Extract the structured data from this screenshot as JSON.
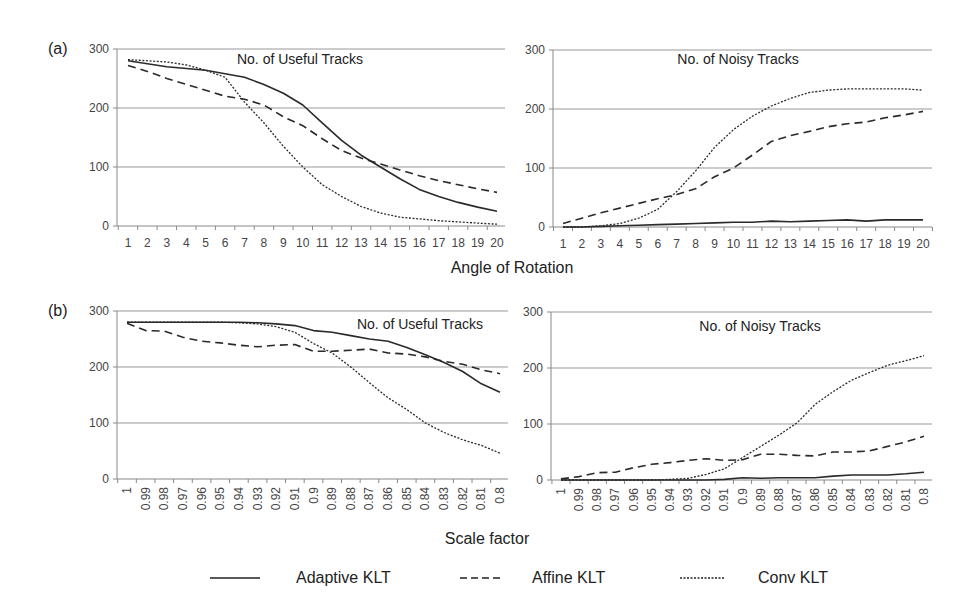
{
  "figure": {
    "panel_labels": [
      "(a)",
      "(b)"
    ],
    "shared_xlabels": {
      "a": "Angle of Rotation",
      "b": "Scale factor"
    },
    "legend": [
      {
        "name": "Adaptive KLT",
        "style": "solid"
      },
      {
        "name": "Affine KLT",
        "style": "dashed"
      },
      {
        "name": "Conv KLT",
        "style": "dotted"
      }
    ]
  },
  "chart_data": [
    {
      "id": "a-useful",
      "type": "line",
      "panel": "(a)",
      "title": "No. of Useful Tracks",
      "xlabel": "Angle of Rotation",
      "ylabel": "",
      "categories": [
        "1",
        "2",
        "3",
        "4",
        "5",
        "6",
        "7",
        "8",
        "9",
        "10",
        "11",
        "12",
        "13",
        "14",
        "15",
        "16",
        "17",
        "18",
        "19",
        "20"
      ],
      "ylim": [
        0,
        300
      ],
      "yticks": [
        0,
        100,
        200,
        300
      ],
      "grid": true,
      "series": [
        {
          "name": "Adaptive KLT",
          "style": "solid",
          "values": [
            280,
            275,
            270,
            267,
            264,
            258,
            252,
            240,
            225,
            205,
            175,
            145,
            120,
            100,
            80,
            62,
            50,
            40,
            32,
            25
          ]
        },
        {
          "name": "Affine KLT",
          "style": "dashed",
          "values": [
            272,
            262,
            250,
            240,
            230,
            220,
            215,
            205,
            185,
            170,
            148,
            128,
            115,
            105,
            95,
            85,
            77,
            70,
            63,
            57
          ]
        },
        {
          "name": "Conv KLT",
          "style": "dotted",
          "values": [
            282,
            280,
            278,
            273,
            264,
            252,
            210,
            175,
            135,
            100,
            70,
            50,
            33,
            22,
            15,
            12,
            9,
            7,
            5,
            3
          ]
        }
      ]
    },
    {
      "id": "a-noisy",
      "type": "line",
      "panel": "(a)",
      "title": "No. of Noisy Tracks",
      "xlabel": "Angle of Rotation",
      "ylabel": "",
      "categories": [
        "1",
        "2",
        "3",
        "4",
        "5",
        "6",
        "7",
        "8",
        "9",
        "10",
        "11",
        "12",
        "13",
        "14",
        "15",
        "16",
        "17",
        "18",
        "19",
        "20"
      ],
      "ylim": [
        0,
        300
      ],
      "yticks": [
        0,
        100,
        200,
        300
      ],
      "grid": true,
      "series": [
        {
          "name": "Adaptive KLT",
          "style": "solid",
          "values": [
            0,
            0,
            1,
            2,
            3,
            4,
            5,
            6,
            7,
            8,
            8,
            10,
            9,
            10,
            11,
            12,
            10,
            12,
            12,
            12
          ]
        },
        {
          "name": "Affine KLT",
          "style": "dashed",
          "values": [
            6,
            15,
            24,
            32,
            40,
            48,
            55,
            65,
            85,
            100,
            122,
            145,
            155,
            162,
            170,
            175,
            178,
            185,
            190,
            196
          ]
        },
        {
          "name": "Conv KLT",
          "style": "dotted",
          "values": [
            0,
            0,
            2,
            6,
            15,
            30,
            60,
            95,
            135,
            165,
            188,
            205,
            218,
            228,
            232,
            234,
            234,
            234,
            234,
            232
          ]
        }
      ]
    },
    {
      "id": "b-useful",
      "type": "line",
      "panel": "(b)",
      "title": "No. of Useful Tracks",
      "xlabel": "Scale factor",
      "ylabel": "",
      "categories": [
        "1",
        "0.99",
        "0.98",
        "0.97",
        "0.96",
        "0.95",
        "0.94",
        "0.93",
        "0.92",
        "0.91",
        "0.9",
        "0.89",
        "0.88",
        "0.87",
        "0.86",
        "0.85",
        "0.84",
        "0.83",
        "0.82",
        "0.81",
        "0.8"
      ],
      "ylim": [
        0,
        300
      ],
      "yticks": [
        0,
        100,
        200,
        300
      ],
      "grid": true,
      "series": [
        {
          "name": "Adaptive KLT",
          "style": "solid",
          "values": [
            280,
            280,
            280,
            280,
            280,
            280,
            280,
            279,
            277,
            274,
            265,
            262,
            256,
            250,
            246,
            235,
            222,
            208,
            192,
            170,
            155
          ]
        },
        {
          "name": "Affine KLT",
          "style": "dashed",
          "values": [
            278,
            265,
            264,
            253,
            246,
            243,
            239,
            236,
            239,
            240,
            228,
            228,
            230,
            232,
            225,
            223,
            218,
            210,
            205,
            195,
            188
          ]
        },
        {
          "name": "Conv KLT",
          "style": "dotted",
          "values": [
            280,
            280,
            280,
            280,
            280,
            280,
            279,
            277,
            272,
            262,
            242,
            225,
            200,
            172,
            145,
            124,
            100,
            83,
            70,
            60,
            46
          ]
        }
      ]
    },
    {
      "id": "b-noisy",
      "type": "line",
      "panel": "(b)",
      "title": "No. of Noisy Tracks",
      "xlabel": "Scale factor",
      "ylabel": "",
      "categories": [
        "1",
        "0.99",
        "0.98",
        "0.97",
        "0.96",
        "0.95",
        "0.94",
        "0.93",
        "0.92",
        "0.91",
        "0.9",
        "0.89",
        "0.88",
        "0.87",
        "0.86",
        "0.85",
        "0.84",
        "0.83",
        "0.82",
        "0.81",
        "0.8"
      ],
      "ylim": [
        0,
        300
      ],
      "yticks": [
        0,
        100,
        200,
        300
      ],
      "grid": true,
      "series": [
        {
          "name": "Adaptive KLT",
          "style": "solid",
          "values": [
            0,
            0,
            0,
            0,
            0,
            0,
            0,
            0,
            0,
            1,
            4,
            3,
            4,
            4,
            4,
            7,
            9,
            9,
            9,
            11,
            14
          ]
        },
        {
          "name": "Affine KLT",
          "style": "dashed",
          "values": [
            2,
            6,
            13,
            14,
            22,
            28,
            31,
            35,
            38,
            35,
            36,
            46,
            46,
            44,
            43,
            50,
            50,
            52,
            60,
            68,
            78
          ]
        },
        {
          "name": "Conv KLT",
          "style": "dotted",
          "values": [
            0,
            0,
            0,
            0,
            0,
            0,
            1,
            3,
            10,
            20,
            40,
            60,
            80,
            102,
            135,
            158,
            178,
            192,
            205,
            213,
            222
          ]
        }
      ]
    }
  ]
}
